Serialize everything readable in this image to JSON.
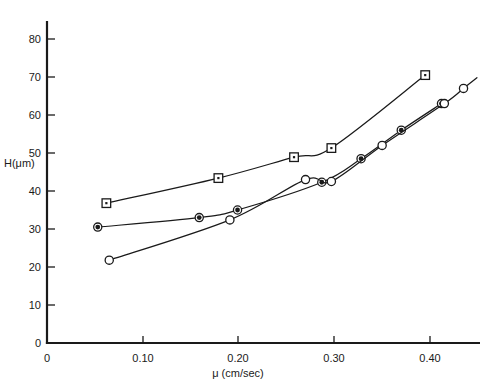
{
  "chart_data": {
    "type": "line",
    "title": "",
    "subtitle": "",
    "xlabel": "μ (cm/sec)",
    "ylabel": "H(μm)",
    "xlim": [
      0,
      0.455
    ],
    "ylim": [
      0,
      85
    ],
    "xticks": [
      0,
      0.1,
      0.2,
      0.3,
      0.4
    ],
    "xticklabels": [
      "0",
      "0.10",
      "0.20",
      "0.30",
      "0.40"
    ],
    "yticks": [
      0,
      10,
      20,
      30,
      40,
      50,
      60,
      70,
      80
    ],
    "yticklabels": [
      "0",
      "10",
      "20",
      "30",
      "40",
      "50",
      "60",
      "70",
      "80"
    ],
    "grid": false,
    "legend": "none",
    "marker_color": "#1a1a1a",
    "line_color": "#1a1a1a",
    "series": [
      {
        "name": "series-squares",
        "marker": "open-square",
        "x": [
          0.062,
          0.179,
          0.258,
          0.297,
          0.395
        ],
        "y": [
          36.8,
          43.4,
          48.9,
          51.3,
          70.5
        ]
      },
      {
        "name": "series-filled-circles",
        "marker": "filled-circle",
        "x": [
          0.053,
          0.159,
          0.199,
          0.287,
          0.328,
          0.37,
          0.412
        ],
        "y": [
          30.5,
          33.0,
          35.0,
          42.3,
          48.5,
          56.0,
          63.0
        ]
      },
      {
        "name": "series-open-circles",
        "marker": "open-circle",
        "x": [
          0.065,
          0.191,
          0.27,
          0.297,
          0.35,
          0.415,
          0.435
        ],
        "y": [
          21.8,
          32.4,
          43.0,
          42.5,
          52.0,
          63.0,
          67.0
        ]
      }
    ]
  },
  "axes": {
    "x_title": "μ (cm/sec)",
    "y_title": "H(μm)",
    "x_tick_0": "0",
    "x_tick_1": "0.10",
    "x_tick_2": "0.20",
    "x_tick_3": "0.30",
    "x_tick_4": "0.40",
    "y_tick_0": "0",
    "y_tick_10": "10",
    "y_tick_20": "20",
    "y_tick_30": "30",
    "y_tick_40": "40",
    "y_tick_50": "50",
    "y_tick_60": "60",
    "y_tick_70": "70",
    "y_tick_80": "80"
  }
}
